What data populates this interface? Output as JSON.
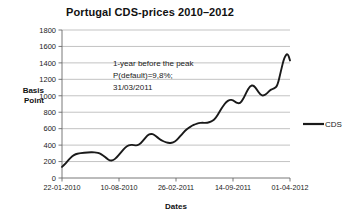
{
  "chart_data": {
    "type": "line",
    "title": "Portugal CDS-prices 2010–2012",
    "xlabel": "Dates",
    "ylabel": "Basis Point",
    "ylabel_line1": "Basis",
    "ylabel_line2": "Point",
    "ylim": [
      0,
      1800
    ],
    "ytick_step": 200,
    "yticks": [
      0,
      200,
      400,
      600,
      800,
      1000,
      1200,
      1400,
      1600,
      1800
    ],
    "xticks": [
      "22-01-2010",
      "10-08-2010",
      "26-02-2011",
      "14-09-2011",
      "01-04-2012"
    ],
    "grid": true,
    "legend_position": "right",
    "legend": [
      "CDS"
    ],
    "series": [
      {
        "name": "CDS",
        "color": "#1a1a1a",
        "x": [
          0.0,
          1.5,
          3.0,
          4.5,
          6.0,
          7.5,
          9.0,
          10.5,
          12.0,
          13.5,
          15.0,
          16.5,
          18.0,
          19.5,
          21.0,
          22.5,
          24.0,
          25.5,
          27.0,
          28.5,
          30.0,
          31.5,
          33.0,
          34.5,
          36.0,
          37.5,
          39.0,
          40.5,
          42.0,
          43.5,
          45.0,
          46.5,
          48.0,
          49.5,
          51.0,
          52.5,
          54.0,
          55.5,
          57.0,
          58.5,
          60.0,
          61.5,
          63.0,
          64.5,
          66.0,
          67.5,
          69.0,
          70.5,
          72.0,
          73.5,
          75.0,
          76.5,
          78.0,
          79.5,
          81.0,
          82.5,
          84.0,
          85.5,
          87.0,
          88.5,
          90.0,
          91.5,
          93.0,
          94.5,
          96.0,
          97.5,
          99.0,
          100.0
        ],
        "values": [
          135,
          175,
          225,
          265,
          290,
          300,
          305,
          310,
          312,
          313,
          310,
          300,
          275,
          240,
          212,
          215,
          250,
          300,
          350,
          390,
          405,
          400,
          395,
          420,
          470,
          520,
          540,
          525,
          490,
          460,
          440,
          428,
          425,
          440,
          480,
          530,
          575,
          610,
          635,
          655,
          668,
          672,
          670,
          675,
          695,
          730,
          800,
          870,
          925,
          952,
          948,
          915,
          905,
          960,
          1050,
          1120,
          1130,
          1075,
          1010,
          1000,
          1030,
          1075,
          1085,
          1120,
          1300,
          1470,
          1520,
          1430
        ]
      }
    ],
    "annotation": {
      "line1": "1-year before the peak",
      "line2": "P(default)=9,8%;",
      "line3": "31/03/2011"
    }
  }
}
